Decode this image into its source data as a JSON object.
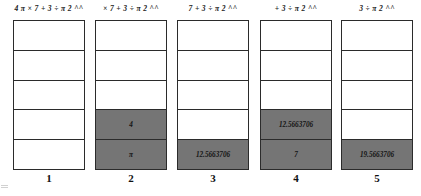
{
  "diagram": {
    "type": "stack-evaluation-sequence",
    "shaded_color": "#757575",
    "border_color": "#2b2b2b",
    "background_color": "#ffffff",
    "stack_rows": 5,
    "steps": [
      {
        "label": "1",
        "expression": "4 π × 7 + 3 ÷ π 2 ^^",
        "cells": [
          "",
          "",
          "",
          "",
          ""
        ],
        "filled": [
          false,
          false,
          false,
          false,
          false
        ]
      },
      {
        "label": "2",
        "expression": "× 7 + 3 ÷ π 2 ^^",
        "cells": [
          "",
          "",
          "",
          "4",
          "π"
        ],
        "filled": [
          false,
          false,
          false,
          true,
          true
        ]
      },
      {
        "label": "3",
        "expression": "7 + 3 ÷ π 2 ^^",
        "cells": [
          "",
          "",
          "",
          "",
          "12.5663706"
        ],
        "filled": [
          false,
          false,
          false,
          false,
          true
        ]
      },
      {
        "label": "4",
        "expression": "+ 3 ÷ π 2 ^^",
        "cells": [
          "",
          "",
          "",
          "12.5663706",
          "7"
        ],
        "filled": [
          false,
          false,
          false,
          true,
          true
        ]
      },
      {
        "label": "5",
        "expression": "3 ÷ π 2 ^^",
        "cells": [
          "",
          "",
          "",
          "",
          "19.5663706"
        ],
        "filled": [
          false,
          false,
          false,
          false,
          true
        ]
      }
    ]
  }
}
